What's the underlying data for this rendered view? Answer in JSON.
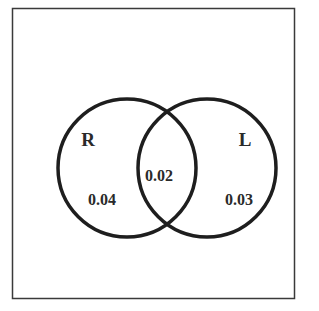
{
  "diagram": {
    "type": "venn",
    "sets": [
      {
        "label": "R",
        "only_value": "0.04"
      },
      {
        "label": "L",
        "only_value": "0.03"
      }
    ],
    "intersection_value": "0.02"
  },
  "colors": {
    "stroke": "#1e1e1e",
    "frame": "#3a3a3a",
    "text": "#2a2a2a"
  }
}
